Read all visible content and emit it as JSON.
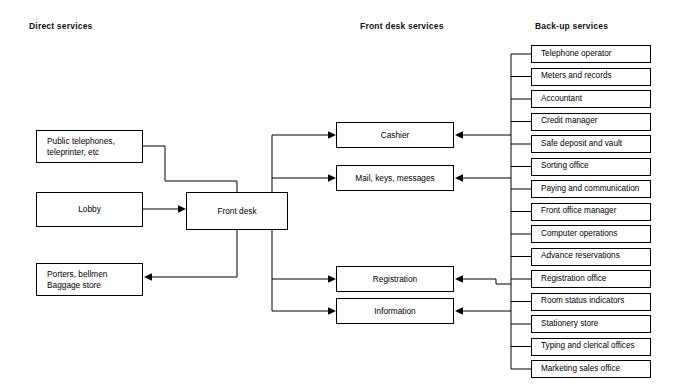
{
  "diagram": {
    "headers": [
      {
        "id": "direct",
        "label": "Direct services"
      },
      {
        "id": "front-desk",
        "label": "Front desk services"
      },
      {
        "id": "backup",
        "label": "Back-up services"
      }
    ],
    "direct_services": [
      {
        "id": "public-telephones",
        "label": "Public telephones,\nteleprinter, etc"
      },
      {
        "id": "lobby",
        "label": "Lobby"
      },
      {
        "id": "porters",
        "label": "Porters, bellmen\nBaggage store"
      }
    ],
    "hub": {
      "id": "front-desk",
      "label": "Front desk"
    },
    "front_desk_services": [
      {
        "id": "cashier",
        "label": "Cashier"
      },
      {
        "id": "mail-keys-messages",
        "label": "Mail, keys, messages"
      },
      {
        "id": "registration",
        "label": "Registration"
      },
      {
        "id": "information",
        "label": "Information"
      }
    ],
    "backup_services": [
      {
        "id": "telephone-operator",
        "label": "Telephone operator"
      },
      {
        "id": "meters-and-records",
        "label": "Meters and records"
      },
      {
        "id": "accountant",
        "label": "Accountant"
      },
      {
        "id": "credit-manager",
        "label": "Credit manager"
      },
      {
        "id": "safe-deposit-and-vault",
        "label": "Safe deposit and vault"
      },
      {
        "id": "sorting-office",
        "label": "Sorting office"
      },
      {
        "id": "paying-and-communication",
        "label": "Paying and communication"
      },
      {
        "id": "front-office-manager",
        "label": "Front office manager"
      },
      {
        "id": "computer-operations",
        "label": "Computer operations"
      },
      {
        "id": "advance-reservations",
        "label": "Advance reservations"
      },
      {
        "id": "registration-office",
        "label": "Registration office"
      },
      {
        "id": "room-status-indicators",
        "label": "Room status indicators"
      },
      {
        "id": "stationery-store",
        "label": "Stationery store"
      },
      {
        "id": "typing-and-clerical-offices",
        "label": "Typing and clerical offices"
      },
      {
        "id": "marketing-sales-office",
        "label": "Marketing sales office"
      }
    ],
    "colors": {
      "background": "#ffffff",
      "stroke": "#000000",
      "text": "#000000"
    }
  }
}
